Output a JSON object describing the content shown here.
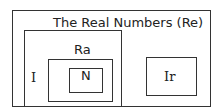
{
  "diagram": {
    "title": "The Real Numbers  (Re)",
    "sets": {
      "rationals": "Ra",
      "integers": "I",
      "naturals": "N",
      "irrationals": "Ir"
    }
  }
}
